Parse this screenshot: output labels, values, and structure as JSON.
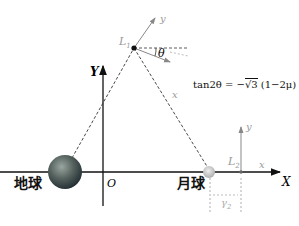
{
  "diagram": {
    "axes": {
      "X": "X",
      "Y": "Y",
      "origin": "O"
    },
    "bodies": {
      "earth": "地球",
      "moon": "月球"
    },
    "points": {
      "L1": {
        "label": "L",
        "sub": "1",
        "local_x": "x",
        "local_y": "y",
        "angle": "θ"
      },
      "L2": {
        "label": "L",
        "sub": "2",
        "local_x": "x",
        "local_y": "y"
      }
    },
    "gamma": {
      "label": "γ",
      "sub": "2"
    },
    "formula": {
      "pre": "tan2θ = −",
      "root": "3",
      "post": " (1−2μ)"
    },
    "colors": {
      "axis": "#111111",
      "gray": "#888888",
      "earth": "#3a4a5a",
      "moon": "#c8c8c8"
    }
  }
}
